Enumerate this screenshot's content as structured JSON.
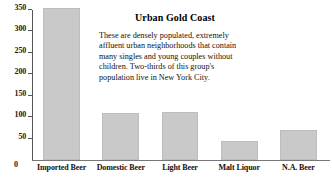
{
  "chart_data": {
    "type": "bar",
    "title": "",
    "categories": [
      "Imported Beer",
      "Domestic Beer",
      "Light Beer",
      "Malt Liquor",
      "N.A. Beer"
    ],
    "values": [
      352,
      109,
      113,
      45,
      71
    ],
    "xlabel": "",
    "ylabel": "",
    "ylim": [
      0,
      350
    ],
    "yticks": [
      0,
      50,
      100,
      150,
      200,
      250,
      300,
      350
    ],
    "ytick_labels": [
      "0",
      "50",
      "100",
      "150",
      "200",
      "250",
      "300",
      "350"
    ],
    "grid": false,
    "legend": "none",
    "bar_color": "#c9c9c9",
    "bar_edge_color": "#bdbdbd",
    "axis_color": "#555555"
  },
  "annotation": {
    "title": "Urban Gold Coast",
    "body": "These are densely populated, extremely affluent urban neighborhoods that contain many singles and young couples without children.  Two-thirds of this group's population live in New York City."
  }
}
